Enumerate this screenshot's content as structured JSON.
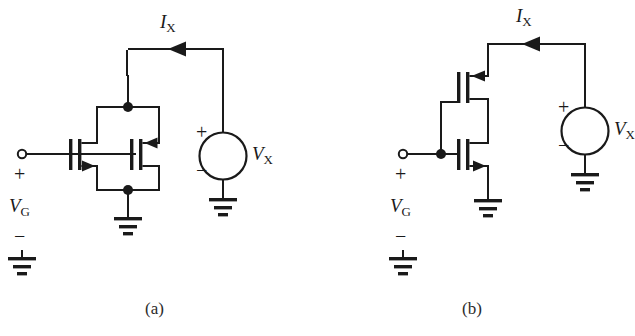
{
  "figure": {
    "background_color": "#ffffff",
    "line_color": "#1a1a1a",
    "subfigures": [
      {
        "caption": "(a)",
        "description": "Two back-to-back NMOS transistors with common gate input VG, drains tied at top node, sources tied at bottom node to ground, top node driven by test source VX through current IX",
        "labels": {
          "current": "I",
          "current_sub": "X",
          "source": "V",
          "source_sub": "X",
          "gate": "V",
          "gate_sub": "G",
          "plus": "+",
          "minus": "−"
        }
      },
      {
        "caption": "(b)",
        "description": "Two stacked NMOS transistors sharing a common gate node VG, upper drain connected to test source VX through current IX, lower source grounded",
        "labels": {
          "current": "I",
          "current_sub": "X",
          "source": "V",
          "source_sub": "X",
          "gate": "V",
          "gate_sub": "G",
          "plus": "+",
          "minus": "−"
        }
      }
    ],
    "symbols": {
      "ground": "ground-symbol",
      "voltage_source": "circle-source-symbol",
      "junction": "node-dot",
      "terminal": "open-circle-terminal",
      "transistor": "nmos-transistor"
    }
  }
}
